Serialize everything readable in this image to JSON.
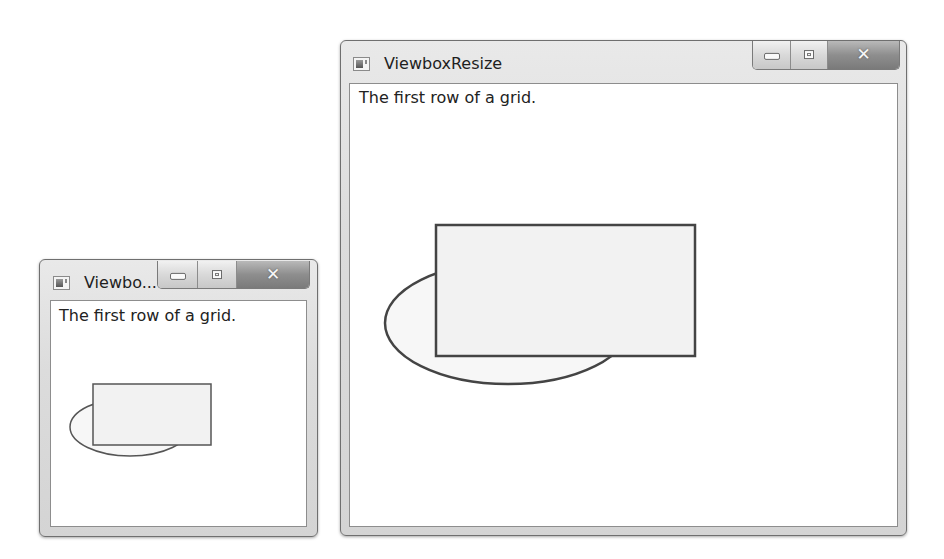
{
  "windows": [
    {
      "id": "small",
      "title": "Viewbo...",
      "row_text": "The first row of a grid.",
      "icon": "app-window-icon",
      "caption_buttons": {
        "minimize": "minimize-icon",
        "maximize": "maximize-icon",
        "close": "close-icon",
        "close_glyph": "✕"
      },
      "shapes": {
        "ellipse": {
          "cx": 130,
          "cy": 427,
          "rx": 60,
          "ry": 29,
          "stroke": "#555555"
        },
        "rect": {
          "x": 93,
          "y": 384,
          "w": 118,
          "h": 61,
          "stroke": "#555555",
          "fill": "#f2f2f2"
        }
      }
    },
    {
      "id": "large",
      "title": "ViewboxResize",
      "row_text": "The first row of a grid.",
      "icon": "app-window-icon",
      "caption_buttons": {
        "minimize": "minimize-icon",
        "maximize": "maximize-icon",
        "close": "close-icon",
        "close_glyph": "✕"
      },
      "shapes": {
        "ellipse": {
          "cx": 508,
          "cy": 323,
          "rx": 123,
          "ry": 61,
          "stroke": "#444444"
        },
        "rect": {
          "x": 436,
          "y": 225,
          "w": 259,
          "h": 131,
          "stroke": "#444444",
          "fill": "#f2f2f2"
        }
      }
    }
  ]
}
